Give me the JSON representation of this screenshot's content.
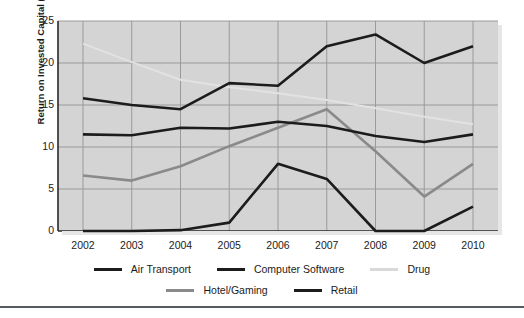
{
  "chart_data": {
    "type": "line",
    "title": "",
    "xlabel": "",
    "ylabel": "Return on Invested Capital (%)",
    "categories": [
      "2002",
      "2003",
      "2004",
      "2005",
      "2006",
      "2007",
      "2008",
      "2009",
      "2010"
    ],
    "x": [
      2002,
      2003,
      2004,
      2005,
      2006,
      2007,
      2008,
      2009,
      2010
    ],
    "ylim": [
      0,
      25
    ],
    "yticks": [
      "0",
      "5",
      "10",
      "15",
      "20",
      "25"
    ],
    "ytick_values": [
      0,
      5,
      10,
      15,
      20,
      25
    ],
    "grid": true,
    "legend_position": "bottom",
    "plot_background": "#d4d4d4",
    "series": [
      {
        "name": "Air Transport",
        "color": "#1c1c1c",
        "width": 2.6,
        "values": [
          11.5,
          11.4,
          12.3,
          12.2,
          13.0,
          12.5,
          11.3,
          10.6,
          11.5
        ]
      },
      {
        "name": "Computer Software",
        "color": "#1c1c1c",
        "width": 2.6,
        "values": [
          15.8,
          15.0,
          14.5,
          17.6,
          17.3,
          22.0,
          23.4,
          20.0,
          22.0
        ]
      },
      {
        "name": "Drug",
        "color": "#e2e2e2",
        "width": 2.0,
        "values": [
          22.3,
          20.1,
          18.0,
          17.1,
          16.4,
          15.6,
          14.6,
          13.6,
          12.7
        ]
      },
      {
        "name": "Hotel/Gaming",
        "color": "#8a8a8a",
        "width": 2.6,
        "values": [
          6.6,
          6.0,
          7.7,
          10.1,
          12.3,
          14.5,
          9.5,
          4.1,
          8.0
        ]
      },
      {
        "name": "Retail",
        "color": "#1c1c1c",
        "width": 2.6,
        "values": [
          0.0,
          0.0,
          0.1,
          1.0,
          8.0,
          6.2,
          0.0,
          0.0,
          2.9
        ]
      }
    ]
  },
  "legend": {
    "row1": [
      {
        "label": "Air Transport",
        "color": "#1c1c1c"
      },
      {
        "label": "Computer Software",
        "color": "#1c1c1c"
      },
      {
        "label": "Drug",
        "color": "#d9d9d9"
      }
    ],
    "row2": [
      {
        "label": "Hotel/Gaming",
        "color": "#8a8a8a"
      },
      {
        "label": "Retail",
        "color": "#1c1c1c"
      }
    ]
  }
}
